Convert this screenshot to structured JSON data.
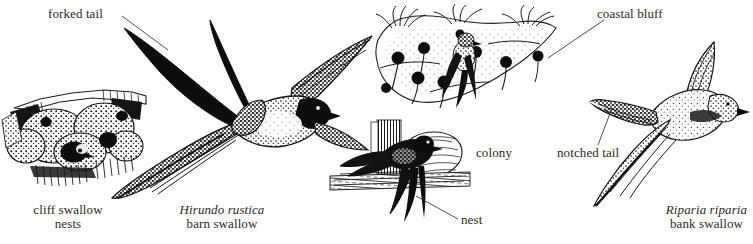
{
  "plate": {
    "width": 753,
    "height": 244,
    "background": "#ffffff",
    "ink": "#231f20",
    "medium": "pen-and-ink stipple engraving"
  },
  "labels": {
    "forked_tail": "forked tail",
    "cliff_swallow_nests_line1": "cliff swallow",
    "cliff_swallow_nests_line2": "nests",
    "barn_swallow_sci": "Hirundo rustica",
    "barn_swallow_common": "barn swallow",
    "nest": "nest",
    "colony": "colony",
    "coastal_bluff": "coastal bluff",
    "notched_tail": "notched tail",
    "bank_swallow_sci": "Riparia riparia",
    "bank_swallow_common": "bank swallow"
  },
  "figures": [
    {
      "id": "cliff-swallow-nests",
      "caption": "cliff swallow nests",
      "description": "cluster of gourd-shaped mud nests built under an eave, one swallow head at a nest entrance"
    },
    {
      "id": "barn-swallow-flight",
      "caption": "Hirundo rustica barn swallow",
      "description": "barn swallow in flight from below showing long deeply forked tail streamers"
    },
    {
      "id": "barn-swallow-nest",
      "caption": "nest",
      "description": "barn swallow alighting at an open cup nest on a wooden beam"
    },
    {
      "id": "bank-swallow-colony",
      "caption": "colony",
      "description": "bank swallow burrow holes dotting the face of a coastal bluff with a swallow at a burrow"
    },
    {
      "id": "bank-swallow-flight",
      "caption": "Riparia riparia bank swallow",
      "description": "bank swallow in flight showing shallow notched tail and brown stippled plumage"
    }
  ]
}
